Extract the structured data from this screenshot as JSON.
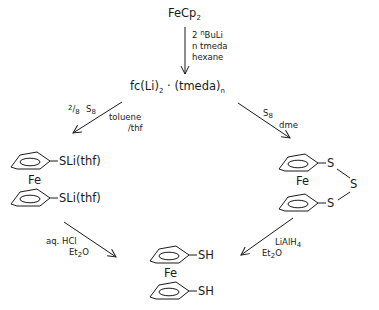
{
  "diagram": {
    "type": "reaction-scheme",
    "start": {
      "formula": "FeCp",
      "subscript": "2"
    },
    "step1": {
      "reagents": [
        {
          "prefix": "2 ",
          "sup": "n",
          "text": "BuLi"
        },
        {
          "text": "n tmeda"
        },
        {
          "text": "hexane"
        }
      ]
    },
    "intermediate": {
      "part1": "fc(Li)",
      "sub1": "2",
      "part2": " · (tmeda)",
      "sub2": "n"
    },
    "left_branch": {
      "reagent_fraction": {
        "num": "2",
        "den": "8"
      },
      "reagent": {
        "text": "S",
        "sub": "8"
      },
      "solvent_lines": [
        "toluene",
        "/thf"
      ],
      "product": {
        "metal": "Fe",
        "substituent_top": "SLi(thf)",
        "substituent_bottom": "SLi(thf)"
      }
    },
    "right_branch": {
      "reagent": {
        "text": "S",
        "sub": "8"
      },
      "solvent": "dme",
      "product": {
        "metal": "Fe",
        "s_top": "S",
        "s_bridge": "S",
        "s_bottom": "S"
      }
    },
    "left_to_final": {
      "line1": "aq. HCl",
      "line2_text": "Et",
      "line2_sub": "2",
      "line2_end": "O"
    },
    "right_to_final": {
      "line1_text": "LiAlH",
      "line1_sub": "4",
      "line2_text": "Et",
      "line2_sub": "2",
      "line2_end": "O"
    },
    "final_product": {
      "metal": "Fe",
      "substituent_top": "SH",
      "substituent_bottom": "SH"
    }
  }
}
